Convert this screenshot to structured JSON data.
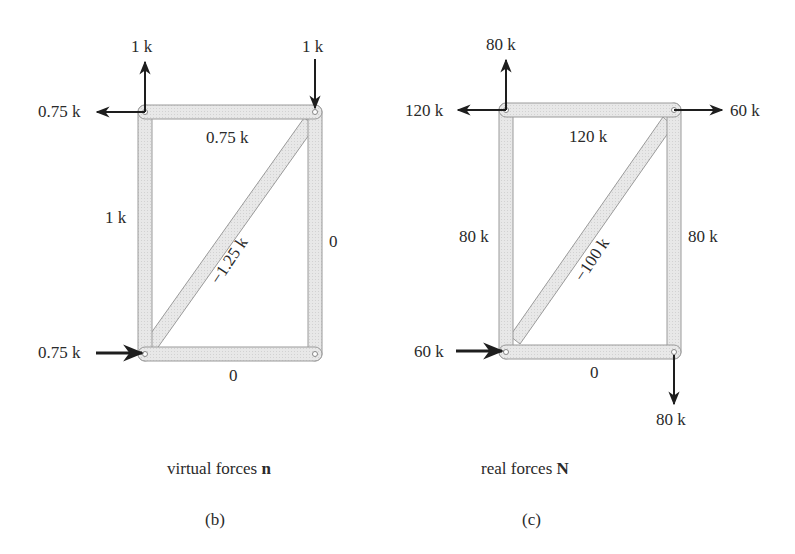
{
  "figures": [
    {
      "id": "b",
      "caption": "virtual forces",
      "caption_symbol": "n",
      "panel_label": "(b)",
      "external_loads": {
        "top_left_up": "1 k",
        "top_left_left": "0.75 k",
        "top_right_down": "1 k",
        "bottom_left_right": "0.75 k"
      },
      "member_forces": {
        "top": "0.75 k",
        "left": "1 k",
        "right": "0",
        "bottom": "0",
        "diagonal": "−1.25 k"
      }
    },
    {
      "id": "c",
      "caption": "real forces",
      "caption_symbol": "N",
      "panel_label": "(c)",
      "external_loads": {
        "top_left_up": "80 k",
        "top_left_left": "120 k",
        "top_right_right": "60 k",
        "bottom_left_right": "60 k",
        "bottom_right_down": "80 k"
      },
      "member_forces": {
        "top": "120 k",
        "left": "80 k",
        "right": "80 k",
        "bottom": "0",
        "diagonal": "−100 k"
      }
    }
  ],
  "colors": {
    "member_fill": "#e6e6e6",
    "member_stroke": "#9a9a9a",
    "arrow": "#1e1e1e"
  }
}
